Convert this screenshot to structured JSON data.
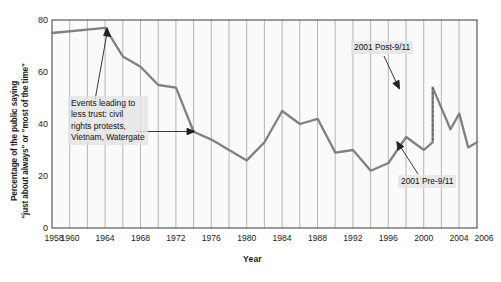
{
  "chart_data": {
    "type": "line",
    "title": "",
    "xlabel": "Year",
    "ylabel_line1": "Percentage of the public saying",
    "ylabel_line2": "\"just about always\" or \"most of the time\"",
    "ylim": [
      0,
      80
    ],
    "xlim": [
      1958,
      2006
    ],
    "yticks": [
      0,
      20,
      40,
      60,
      80
    ],
    "ytick_labels": [
      "0",
      "20",
      "40",
      "60",
      "80"
    ],
    "xticks": [
      1958,
      1960,
      1964,
      1968,
      1972,
      1976,
      1980,
      1984,
      1988,
      1992,
      1996,
      2000,
      2004,
      2006
    ],
    "xtick_labels": [
      "1958",
      "1960",
      "1964",
      "1968",
      "1972",
      "1976",
      "1980",
      "1984",
      "1988",
      "1992",
      "1996",
      "2000",
      "2004",
      "2006"
    ],
    "grid": "vertical",
    "legend": "none",
    "line_color": "#808080",
    "series": [
      {
        "name": "Trust in government",
        "x": [
          1958,
          1964,
          1966,
          1968,
          1970,
          1972,
          1974,
          1976,
          1978,
          1980,
          1982,
          1984,
          1986,
          1988,
          1990,
          1992,
          1994,
          1996,
          1998,
          2000,
          2001,
          2001,
          2002,
          2003,
          2004,
          2005,
          2006
        ],
        "values": [
          75,
          77,
          66,
          62,
          55,
          54,
          37,
          34,
          30,
          26,
          33,
          45,
          40,
          42,
          29,
          30,
          22,
          25,
          35,
          30,
          33,
          54,
          46,
          38,
          44,
          31,
          33
        ]
      }
    ],
    "annotations": [
      {
        "name": "events-leading-to-less-trust",
        "text_lines": [
          "Events leading to",
          "less trust: civil",
          "rights protests,",
          "Vietnam, Watergate"
        ],
        "arrows": 2
      },
      {
        "name": "post-9-11",
        "text": "2001 Post-9/11"
      },
      {
        "name": "pre-9-11",
        "text": "2001 Pre-9/11"
      }
    ],
    "marker_line": {
      "name": "2001-dotted-connector",
      "style": "dotted",
      "x": 2001,
      "y_from": 33,
      "y_to": 54
    }
  }
}
